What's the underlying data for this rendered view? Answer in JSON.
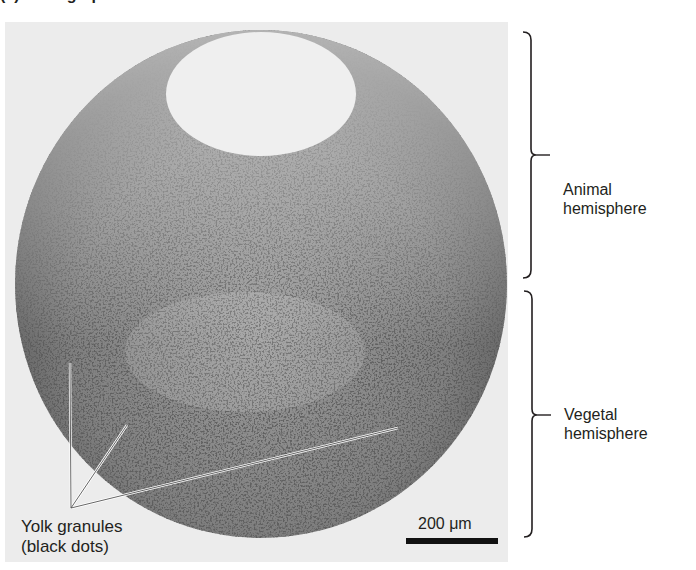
{
  "figure": {
    "title_fragment": "(a) Micrograph",
    "photo": {
      "description": "Cross-section micrograph of an amphibian egg showing yolk granules",
      "background_color": "#e9e9e9",
      "egg_color": "#8c8c8c",
      "cavity_color": "#efefef",
      "granule_color": "#1e1e1e"
    },
    "brackets": [
      {
        "id": "animal",
        "label_line1": "Animal",
        "label_line2": "hemisphere"
      },
      {
        "id": "vegetal",
        "label_line1": "Vegetal",
        "label_line2": "hemisphere"
      }
    ],
    "pointer_label": {
      "line1": "Yolk granules",
      "line2": "(black dots)"
    },
    "scale_bar": {
      "label": "200 μm",
      "length_px": 92
    }
  }
}
